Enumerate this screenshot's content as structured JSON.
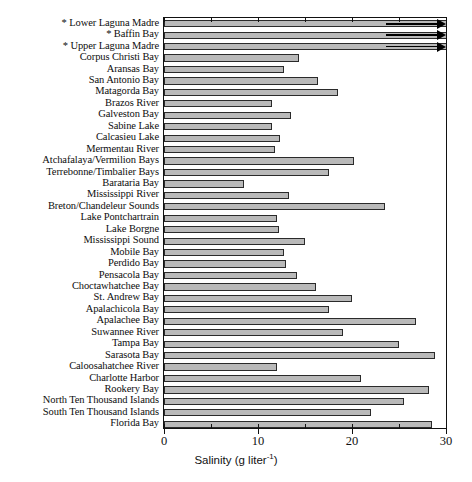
{
  "chart": {
    "type": "bar",
    "orientation": "horizontal",
    "title": "",
    "xlabel_text": "Salinity (g liter",
    "xlabel_sup": "-1",
    "xlabel_close": ")",
    "xlabel_full": "Salinity (g liter-1)",
    "ylabel": "",
    "xlim": [
      0,
      30
    ],
    "xticks": [
      0,
      10,
      20,
      30
    ],
    "xticklabels": [
      "0",
      "10",
      "20",
      "30"
    ],
    "grid": false,
    "legend": null,
    "bar_color": "#b9b9b9",
    "bar_edge_color": "#2a2a2a",
    "note": "Bars marked with * exceed the axis maximum and are drawn clipped with arrowheads"
  },
  "chart_data": {
    "type": "bar",
    "xlabel": "Salinity (g liter-1)",
    "ylabel": "",
    "xlim": [
      0,
      30
    ],
    "xticks": [
      0,
      10,
      20,
      30
    ],
    "grid": false,
    "categories": [
      "Lower Laguna Madre",
      "Baffin Bay",
      "Upper Laguna Madre",
      "Corpus Christi Bay",
      "Aransas Bay",
      "San Antonio Bay",
      "Matagorda Bay",
      "Brazos River",
      "Galveston Bay",
      "Sabine Lake",
      "Calcasieu Lake",
      "Mermentau River",
      "Atchafalaya/Vermilion Bays",
      "Terrebonne/Timbalier Bays",
      "Barataria Bay",
      "Mississippi River",
      "Breton/Chandeleur Sounds",
      "Lake Pontchartrain",
      "Lake Borgne",
      "Mississippi Sound",
      "Mobile Bay",
      "Perdido Bay",
      "Pensacola Bay",
      "Choctawhatchee Bay",
      "St. Andrew Bay",
      "Apalachicola Bay",
      "Apalachee Bay",
      "Suwannee River",
      "Tampa Bay",
      "Sarasota Bay",
      "Caloosahatchee River",
      "Charlotte Harbor",
      "Rookery Bay",
      "North Ten Thousand Islands",
      "South Ten Thousand Islands",
      "Florida Bay"
    ],
    "values": [
      30,
      30,
      30,
      14.4,
      12.8,
      16.4,
      18.5,
      11.5,
      13.5,
      11.5,
      12.3,
      11.8,
      20.2,
      17.5,
      8.5,
      13.3,
      23.5,
      12.0,
      12.2,
      15.0,
      12.8,
      13.0,
      14.2,
      16.2,
      20.0,
      17.5,
      26.8,
      19.0,
      25.0,
      28.8,
      12.0,
      21.0,
      28.2,
      25.5,
      22.0,
      28.5
    ],
    "starred": [
      "Lower Laguna Madre",
      "Baffin Bay",
      "Upper Laguna Madre"
    ],
    "starred_note": "* indicates value exceeds 30 g liter-1 (axis truncated, arrowhead shown)"
  },
  "labels": [
    {
      "star": "*",
      "text": "Lower Laguna Madre"
    },
    {
      "star": "*",
      "text": "Baffin Bay"
    },
    {
      "star": "*",
      "text": "Upper Laguna Madre"
    },
    {
      "star": "",
      "text": "Corpus Christi Bay"
    },
    {
      "star": "",
      "text": "Aransas Bay"
    },
    {
      "star": "",
      "text": "San Antonio Bay"
    },
    {
      "star": "",
      "text": "Matagorda Bay"
    },
    {
      "star": "",
      "text": "Brazos River"
    },
    {
      "star": "",
      "text": "Galveston Bay"
    },
    {
      "star": "",
      "text": "Sabine Lake"
    },
    {
      "star": "",
      "text": "Calcasieu Lake"
    },
    {
      "star": "",
      "text": "Mermentau River"
    },
    {
      "star": "",
      "text": "Atchafalaya/Vermilion Bays"
    },
    {
      "star": "",
      "text": "Terrebonne/Timbalier Bays"
    },
    {
      "star": "",
      "text": "Barataria Bay"
    },
    {
      "star": "",
      "text": "Mississippi River"
    },
    {
      "star": "",
      "text": "Breton/Chandeleur Sounds"
    },
    {
      "star": "",
      "text": "Lake Pontchartrain"
    },
    {
      "star": "",
      "text": "Lake Borgne"
    },
    {
      "star": "",
      "text": "Mississippi Sound"
    },
    {
      "star": "",
      "text": "Mobile Bay"
    },
    {
      "star": "",
      "text": "Perdido Bay"
    },
    {
      "star": "",
      "text": "Pensacola Bay"
    },
    {
      "star": "",
      "text": "Choctawhatchee Bay"
    },
    {
      "star": "",
      "text": "St. Andrew Bay"
    },
    {
      "star": "",
      "text": "Apalachicola Bay"
    },
    {
      "star": "",
      "text": "Apalachee Bay"
    },
    {
      "star": "",
      "text": "Suwannee River"
    },
    {
      "star": "",
      "text": "Tampa Bay"
    },
    {
      "star": "",
      "text": "Sarasota Bay"
    },
    {
      "star": "",
      "text": "Caloosahatchee River"
    },
    {
      "star": "",
      "text": "Charlotte Harbor"
    },
    {
      "star": "",
      "text": "Rookery Bay"
    },
    {
      "star": "",
      "text": "North Ten Thousand Islands"
    },
    {
      "star": "",
      "text": "South Ten Thousand Islands"
    },
    {
      "star": "",
      "text": "Florida Bay"
    }
  ]
}
